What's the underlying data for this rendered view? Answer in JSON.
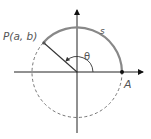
{
  "diagram": {
    "type": "unit-circle-angle",
    "labels": {
      "point_p": "P(a, b)",
      "point_a": "A",
      "arc": "s",
      "angle": "θ"
    },
    "colors": {
      "arc_solid": "#808080",
      "circle_dashed": "#555555",
      "axes": "#222222",
      "text": "#555555"
    }
  }
}
